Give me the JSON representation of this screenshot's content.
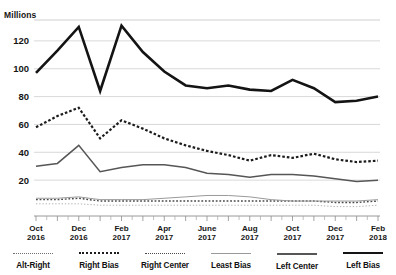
{
  "cut_title": "graph title cropped at top edge",
  "axis": {
    "unit_label": "Millions",
    "ylabel": "Millions",
    "xlabel": ""
  },
  "chart_data": {
    "type": "line",
    "title": "",
    "subtitle": "",
    "xlabel": "",
    "ylabel": "Millions",
    "ylim": [
      0,
      135
    ],
    "yticks": [
      20,
      40,
      60,
      80,
      100,
      120
    ],
    "ytick_labels": [
      "20",
      "40",
      "60",
      "80",
      "100",
      "120"
    ],
    "grid": true,
    "grid_axis": "y",
    "legend_position": "bottom",
    "x": [
      "Oct 2016",
      "Nov 2016",
      "Dec 2016",
      "Jan 2017",
      "Feb 2017",
      "Mar 2017",
      "Apr 2017",
      "May 2017",
      "June 2017",
      "July 2017",
      "Aug 2017",
      "Sep 2017",
      "Oct 2017",
      "Nov 2017",
      "Dec 2017",
      "Jan 2018",
      "Feb 2018"
    ],
    "categories": [
      "Oct 2016",
      "Nov 2016",
      "Dec 2016",
      "Jan 2017",
      "Feb 2017",
      "Mar 2017",
      "Apr 2017",
      "May 2017",
      "June 2017",
      "July 2017",
      "Aug 2017",
      "Sep 2017",
      "Oct 2017",
      "Nov 2017",
      "Dec 2017",
      "Jan 2018",
      "Feb 2018"
    ],
    "xtick_labels": [
      "Oct\n2016",
      "Dec\n2016",
      "Feb\n2017",
      "Apr\n2017",
      "June\n2017",
      "Aug\n2017",
      "Oct\n2017",
      "Dec\n2017",
      "Feb\n2018"
    ],
    "xtick_labels_split": [
      {
        "month": "Oct",
        "year": "2016"
      },
      {
        "month": "Dec",
        "year": "2016"
      },
      {
        "month": "Feb",
        "year": "2017"
      },
      {
        "month": "Apr",
        "year": "2017"
      },
      {
        "month": "June",
        "year": "2017"
      },
      {
        "month": "Aug",
        "year": "2017"
      },
      {
        "month": "Oct",
        "year": "2017"
      },
      {
        "month": "Dec",
        "year": "2017"
      },
      {
        "month": "Feb",
        "year": "2018"
      }
    ],
    "series": [
      {
        "name": "Left Bias",
        "style": "solid-thick",
        "color": "#141414",
        "values": [
          97,
          113,
          130,
          84,
          131,
          112,
          98,
          88,
          86,
          88,
          85,
          84,
          92,
          86,
          76,
          77,
          80
        ]
      },
      {
        "name": "Right Bias",
        "style": "dashed-bold",
        "color": "#1c1c1c",
        "values": [
          58,
          66,
          72,
          50,
          63,
          57,
          50,
          45,
          41,
          38,
          34,
          38,
          36,
          39,
          35,
          33,
          34
        ]
      },
      {
        "name": "Left Center",
        "style": "solid-medium",
        "color": "#565656",
        "values": [
          30,
          32,
          45,
          26,
          29,
          31,
          31,
          29,
          25,
          24,
          22,
          24,
          24,
          23,
          21,
          19,
          20
        ]
      },
      {
        "name": "Least Bias",
        "style": "solid-thin",
        "color": "#9a9a9a",
        "values": [
          7,
          7,
          8,
          6,
          6,
          6,
          7,
          8,
          9,
          9,
          8,
          6,
          5,
          5,
          5,
          5,
          6
        ]
      },
      {
        "name": "Right Center",
        "style": "dotted",
        "color": "#4a4a4a",
        "values": [
          6,
          6,
          7,
          5,
          5,
          5,
          5,
          5,
          5,
          5,
          5,
          5,
          5,
          5,
          4,
          4,
          5
        ]
      },
      {
        "name": "Alt-Right",
        "style": "dotted-fine",
        "color": "#b4b4b4",
        "values": [
          3,
          3,
          3,
          2,
          2,
          2,
          2,
          2,
          2,
          2,
          2,
          2,
          2,
          2,
          1,
          1,
          2
        ]
      }
    ]
  },
  "legend": {
    "items": [
      {
        "label": "Alt-Right",
        "swatch": "fine-dot"
      },
      {
        "label": "Right Bias",
        "swatch": "bold-dash"
      },
      {
        "label": "Right Center",
        "swatch": "dot"
      },
      {
        "label": "Least Bias",
        "swatch": "thin"
      },
      {
        "label": "Left Center",
        "swatch": "med"
      },
      {
        "label": "Left Bias",
        "swatch": "thick"
      }
    ]
  }
}
